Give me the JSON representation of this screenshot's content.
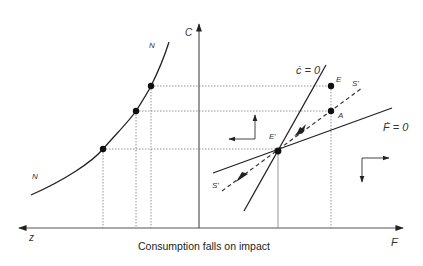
{
  "caption": "Consumption falls on impact",
  "colors": {
    "line": "#222222",
    "guide": "#7a7a7a",
    "axis": "#555555",
    "background": "#ffffff"
  },
  "labels": {
    "c_axis": "C",
    "z_axis": "z",
    "f_axis": "F",
    "n_upper": "N",
    "n_lower": "N",
    "c_dot_zero": "ċ = 0",
    "f_dot_zero": "Ḟ = 0",
    "point_e": "E",
    "point_a": "A",
    "point_e_prime": "E'",
    "saddle_upper": "S'",
    "saddle_lower": "S'"
  },
  "points": {
    "E": [
      331,
      86
    ],
    "A": [
      331,
      111
    ],
    "E_prime": [
      278,
      151
    ],
    "N1": [
      151,
      86
    ],
    "N2": [
      136,
      111
    ],
    "N3": [
      103,
      149
    ]
  },
  "axes": {
    "origin": [
      199,
      228
    ],
    "c_arrow_tip": [
      199,
      21
    ],
    "z_arrow_tip": [
      16,
      228
    ],
    "f_arrow_tip": [
      406,
      228
    ]
  }
}
